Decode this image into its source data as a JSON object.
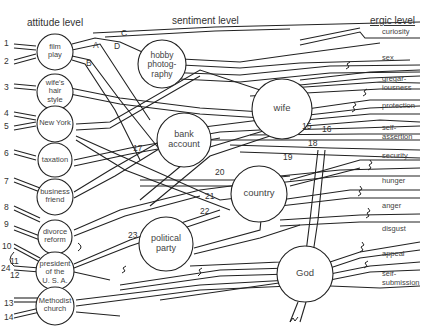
{
  "headings": {
    "attitude": "attitude level",
    "sentiment": "sentiment level",
    "ergic": "ergic level"
  },
  "attitude_nodes": [
    {
      "id": "film",
      "label1": "film",
      "label2": "play"
    },
    {
      "id": "wife-hair",
      "label1": "wife's",
      "label2": "hair",
      "label3": "style"
    },
    {
      "id": "new-york",
      "label1": "New York"
    },
    {
      "id": "taxation",
      "label1": "taxation"
    },
    {
      "id": "business-friend",
      "label1": "business",
      "label2": "friend"
    },
    {
      "id": "divorce-reform",
      "label1": "divorce",
      "label2": "reform"
    },
    {
      "id": "president",
      "label1": "president",
      "label2": "of the",
      "label3": "U. S. A."
    },
    {
      "id": "methodist",
      "label1": "Methodist",
      "label2": "church"
    }
  ],
  "sentiment_nodes": [
    {
      "id": "hobby",
      "label1": "hobby",
      "label2": "photog-",
      "label3": "raphy"
    },
    {
      "id": "wife",
      "label1": "wife"
    },
    {
      "id": "bank",
      "label1": "bank",
      "label2": "account"
    },
    {
      "id": "country",
      "label1": "country"
    },
    {
      "id": "political",
      "label1": "political",
      "label2": "party"
    },
    {
      "id": "god",
      "label1": "God"
    }
  ],
  "ergic_goals": [
    {
      "label1": "curiosity"
    },
    {
      "label1": "sex"
    },
    {
      "label1": "gregar-",
      "label2": "iousness"
    },
    {
      "label1": "protection"
    },
    {
      "label1": "self-",
      "label2": "assertion"
    },
    {
      "label1": "security"
    },
    {
      "label1": "hunger"
    },
    {
      "label1": "anger"
    },
    {
      "label1": "disgust"
    },
    {
      "label1": "appeal"
    },
    {
      "label1": "self-",
      "label2": "submission"
    }
  ],
  "path_numbers": [
    "1",
    "2",
    "3",
    "4",
    "5",
    "6",
    "7",
    "8",
    "9",
    "10",
    "11",
    "12",
    "13",
    "14",
    "15",
    "16",
    "17",
    "18",
    "19",
    "20",
    "21",
    "22",
    "23",
    "24"
  ],
  "path_letters": [
    "A",
    "B",
    "C",
    "D"
  ]
}
